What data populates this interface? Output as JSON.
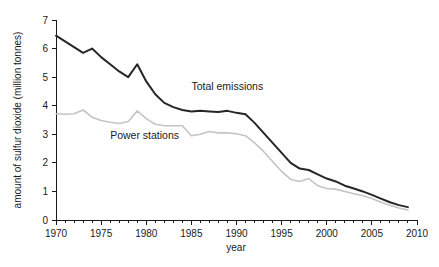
{
  "chart_data": {
    "type": "line",
    "title": "",
    "xlabel": "year",
    "ylabel": "amount of sulfur dioxide (million tonnes)",
    "xlim": [
      1970,
      2010
    ],
    "ylim": [
      0,
      7
    ],
    "grid": false,
    "legend_position": "inline-annotations",
    "x_tick_labels": [
      "1970",
      "1975",
      "1980",
      "1985",
      "1990",
      "1995",
      "2000",
      "2005",
      "2010"
    ],
    "x_tick_values": [
      1970,
      1975,
      1980,
      1985,
      1990,
      1995,
      2000,
      2005,
      2010
    ],
    "x_minor_tick_interval": 1,
    "y_tick_labels": [
      "0",
      "1",
      "2",
      "3",
      "4",
      "5",
      "6",
      "7"
    ],
    "y_tick_values": [
      0,
      1,
      2,
      3,
      4,
      5,
      6,
      7
    ],
    "x": [
      1970,
      1971,
      1972,
      1973,
      1974,
      1975,
      1976,
      1977,
      1978,
      1979,
      1980,
      1981,
      1982,
      1983,
      1984,
      1985,
      1986,
      1987,
      1988,
      1989,
      1990,
      1991,
      1992,
      1993,
      1994,
      1995,
      1996,
      1997,
      1998,
      1999,
      2000,
      2001,
      2002,
      2003,
      2004,
      2005,
      2006,
      2007,
      2008,
      2009
    ],
    "series": [
      {
        "name": "Total emissions",
        "color": "#262626",
        "label_x": 1985,
        "label_y": 4.55,
        "values": [
          6.45,
          6.25,
          6.05,
          5.85,
          6.0,
          5.7,
          5.45,
          5.2,
          5.0,
          5.45,
          4.85,
          4.4,
          4.1,
          3.95,
          3.85,
          3.8,
          3.82,
          3.8,
          3.78,
          3.82,
          3.75,
          3.7,
          3.4,
          3.05,
          2.7,
          2.35,
          2.0,
          1.8,
          1.75,
          1.6,
          1.45,
          1.35,
          1.2,
          1.1,
          1.0,
          0.88,
          0.75,
          0.62,
          0.52,
          0.45
        ]
      },
      {
        "name": "Power stations",
        "color": "#c4c4c4",
        "label_x": 1976,
        "label_y": 2.85,
        "values": [
          3.72,
          3.7,
          3.72,
          3.85,
          3.6,
          3.48,
          3.42,
          3.38,
          3.45,
          3.82,
          3.55,
          3.35,
          3.3,
          3.3,
          3.3,
          2.95,
          3.0,
          3.1,
          3.05,
          3.05,
          3.02,
          2.95,
          2.7,
          2.4,
          2.05,
          1.7,
          1.42,
          1.35,
          1.45,
          1.2,
          1.1,
          1.08,
          1.0,
          0.92,
          0.85,
          0.75,
          0.62,
          0.52,
          0.42,
          0.35
        ]
      }
    ]
  },
  "labels": {
    "series_total": "Total emissions",
    "series_power": "Power stations",
    "x_axis_title": "year",
    "y_axis_title": "amount of sulfur dioxide (million tonnes)"
  }
}
